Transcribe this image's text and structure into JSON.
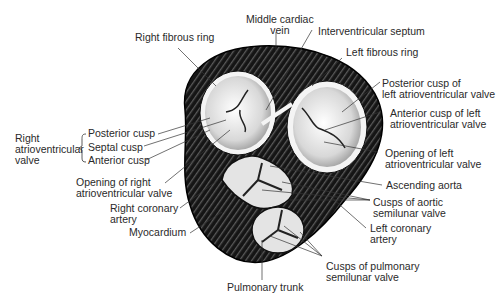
{
  "diagram": {
    "labels": {
      "middle_cardiac_vein": [
        "Middle cardiac",
        "vein"
      ],
      "interventricular_septum": "Interventricular septum",
      "right_fibrous_ring": "Right fibrous ring",
      "left_fibrous_ring": "Left fibrous ring",
      "posterior_cusp_left": [
        "Posterior cusp of",
        "left atrioventricular valve"
      ],
      "anterior_cusp_left": [
        "Anterior cusp of left",
        "atrioventricular valve"
      ],
      "right_av_valve": [
        "Right",
        "atrioventricular",
        "valve"
      ],
      "posterior_cusp": "Posterior cusp",
      "septal_cusp": "Septal cusp",
      "anterior_cusp": "Anterior cusp",
      "opening_right": [
        "Opening of right",
        "atrioventricular valve"
      ],
      "opening_left": [
        "Opening of left",
        "atrioventricular valve"
      ],
      "ascending_aorta": "Ascending aorta",
      "right_coronary": [
        "Right coronary",
        "artery"
      ],
      "cusps_aortic": [
        "Cusps of aortic",
        "semilunar valve"
      ],
      "myocardium": "Myocardium",
      "left_coronary": [
        "Left coronary",
        "artery"
      ],
      "cusps_pulmonary": [
        "Cusps of pulmonary",
        "semilunar valve"
      ],
      "pulmonary_trunk": "Pulmonary trunk"
    },
    "colors": {
      "muscle": "#1a1a1a",
      "valve": "#e8e8e8",
      "ring": "#f4f4f4",
      "leader": "#333333"
    }
  }
}
